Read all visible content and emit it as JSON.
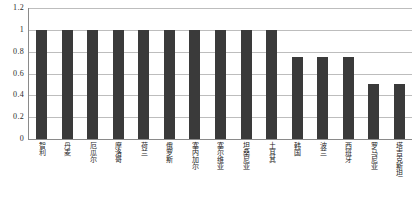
{
  "chart_data": {
    "type": "bar",
    "title": "",
    "subtitle": "",
    "xlabel": "",
    "ylabel": "",
    "ylim": [
      0,
      1.2
    ],
    "grid": true,
    "legend": false,
    "legend_position": "none",
    "bar_color": "#3a3a3a",
    "gridline_color": "#bdbdbd",
    "axis_color": "#8a8a8a",
    "background_color": "#ffffff",
    "y_ticks": [
      "0",
      "0.2",
      "0.4",
      "0.6",
      "0.8",
      "1",
      "1.2"
    ],
    "y_tick_values": [
      0,
      0.2,
      0.4,
      0.6,
      0.8,
      1,
      1.2
    ],
    "categories": [
      "智利",
      "丹麦",
      "厄瓜尔",
      "摩洛哥",
      "荷兰",
      "俄罗斯",
      "塞内加尔",
      "塞尔维亚",
      "坦桑尼亚",
      "土耳其",
      "韩国",
      "波兰",
      "西班牙",
      "罗马尼亚",
      "塔吉克斯坦"
    ],
    "values": [
      1,
      1,
      1,
      1,
      1,
      1,
      1,
      1,
      1,
      1,
      0.75,
      0.75,
      0.75,
      0.5,
      0.5
    ]
  }
}
